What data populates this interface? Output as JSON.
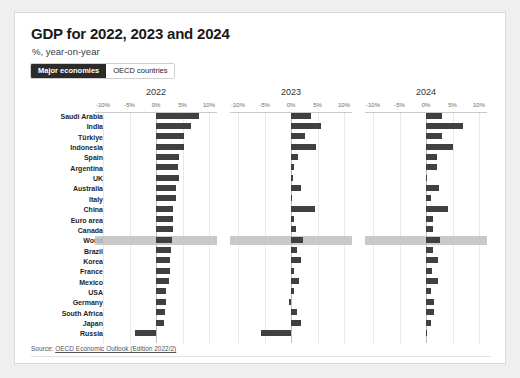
{
  "header": {
    "title": "GDP for 2022, 2023 and 2024",
    "subtitle": "%, year-on-year"
  },
  "toggle": {
    "active_label": "Major economies",
    "inactive_label": "OECD countries"
  },
  "footer": {
    "source_prefix": "Source: ",
    "source_link": "OECD Economic Outlook (Edition 2022/2)"
  },
  "colors": {
    "bar": "#404040",
    "highlight_band": "#bfbfbf",
    "toggle_active_bg": "#2b2b2b",
    "card_bg": "#ffffff",
    "page_bg": "#efefef"
  },
  "chart_data": {
    "type": "bar",
    "title": "GDP for 2022, 2023 and 2024",
    "subtitle": "%, year-on-year",
    "xlabel": "",
    "ylabel": "",
    "grid": true,
    "legend": "none",
    "orientation": "horizontal",
    "panels": [
      "2022",
      "2023",
      "2024"
    ],
    "xlim": [
      -12,
      12
    ],
    "xticks": [
      -10,
      -5,
      0,
      5,
      10
    ],
    "xtick_labels": [
      "-10%",
      "-5%",
      "0%",
      "5%",
      "10%"
    ],
    "highlight_category": "World",
    "categories": [
      "Saudi Arabia",
      "India",
      "Türkiye",
      "Indonesia",
      "Spain",
      "Argentina",
      "UK",
      "Australia",
      "Italy",
      "China",
      "Euro area",
      "Canada",
      "World",
      "Brazil",
      "Korea",
      "France",
      "Mexico",
      "USA",
      "Germany",
      "South Africa",
      "Japan",
      "Russia"
    ],
    "series": [
      {
        "name": "2022",
        "values": [
          8.2,
          6.6,
          5.3,
          5.3,
          4.4,
          4.2,
          4.4,
          3.8,
          3.7,
          3.3,
          3.3,
          3.2,
          3.1,
          2.8,
          2.7,
          2.6,
          2.5,
          1.8,
          1.8,
          1.7,
          1.6,
          -3.9
        ]
      },
      {
        "name": "2023",
        "values": [
          3.8,
          5.7,
          2.6,
          4.7,
          1.3,
          0.5,
          0.4,
          1.8,
          0.2,
          4.6,
          0.5,
          1.0,
          2.2,
          1.2,
          1.8,
          0.6,
          1.6,
          0.5,
          -0.3,
          1.1,
          1.8,
          -5.6
        ]
      },
      {
        "name": "2024",
        "values": [
          3.1,
          6.9,
          3.0,
          5.1,
          2.1,
          2.0,
          0.2,
          2.4,
          1.0,
          4.1,
          1.4,
          1.3,
          2.7,
          1.4,
          2.3,
          1.2,
          2.2,
          1.0,
          1.5,
          1.6,
          0.9,
          0.2
        ]
      }
    ]
  }
}
